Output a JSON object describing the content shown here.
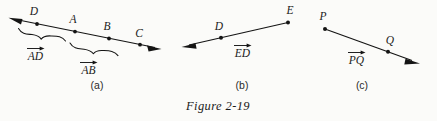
{
  "figure": {
    "caption": "Figure 2-19",
    "background_color": "#fbfbf9",
    "ink_color": "#141414"
  },
  "panels": [
    {
      "id": "a",
      "label": "(a)",
      "points": [
        "D",
        "A",
        "B",
        "C"
      ],
      "point_labels": [
        {
          "name": "D",
          "text": "D"
        },
        {
          "name": "A",
          "text": "A"
        },
        {
          "name": "B",
          "text": "B"
        },
        {
          "name": "C",
          "text": "C"
        }
      ],
      "vector_labels": [
        {
          "name": "AD",
          "letters": "AD"
        },
        {
          "name": "AB",
          "letters": "AB"
        }
      ],
      "line_type": "double-headed",
      "arrowheads": [
        "left",
        "right"
      ]
    },
    {
      "id": "b",
      "label": "(b)",
      "points": [
        "D",
        "E"
      ],
      "point_labels": [
        {
          "name": "D",
          "text": "D"
        },
        {
          "name": "E",
          "text": "E"
        }
      ],
      "vector_labels": [
        {
          "name": "ED",
          "letters": "ED"
        }
      ],
      "line_type": "ray",
      "arrowheads": [
        "left"
      ]
    },
    {
      "id": "c",
      "label": "(c)",
      "points": [
        "P",
        "Q"
      ],
      "point_labels": [
        {
          "name": "P",
          "text": "P"
        },
        {
          "name": "Q",
          "text": "Q"
        }
      ],
      "vector_labels": [
        {
          "name": "PQ",
          "letters": "PQ"
        }
      ],
      "line_type": "ray",
      "arrowheads": [
        "right"
      ]
    }
  ]
}
